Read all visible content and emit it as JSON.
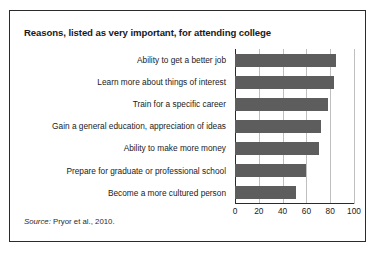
{
  "chart_data": {
    "type": "bar",
    "orientation": "horizontal",
    "title": "Reasons, listed as very important, for attending college",
    "categories": [
      "Ability to get a better job",
      "Learn more about things of interest",
      "Train for a specific career",
      "Gain a general education, appreciation of ideas",
      "Ability to make more money",
      "Prepare for graduate or professional school",
      "Become a more cultured person"
    ],
    "values": [
      85,
      83,
      78,
      72,
      71,
      60,
      51
    ],
    "xlabel": "",
    "ylabel": "",
    "xlim": [
      0,
      100
    ],
    "xticks": [
      0,
      20,
      40,
      60,
      80,
      100
    ],
    "xtick_labels": [
      "0",
      "20",
      "40",
      "60",
      "80",
      "100"
    ],
    "grid": true,
    "grid_axis": "x",
    "legend": false,
    "bar_color": "#5d5d5d",
    "gridline_color": "#bfbfbf",
    "axis_color": "#2b2b2b"
  },
  "source": {
    "label": "Source:",
    "text": " Pryor et al., 2010."
  }
}
